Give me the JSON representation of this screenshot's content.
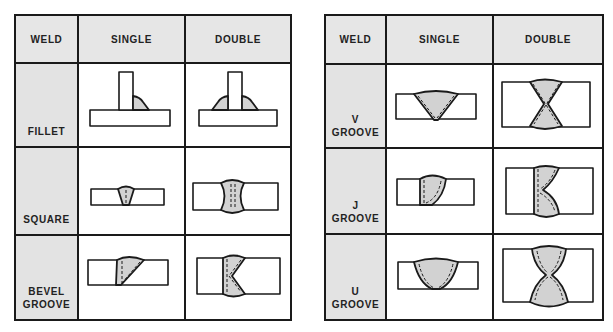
{
  "colors": {
    "header_bg": "#e6e6e6",
    "label_bg": "#e3e3e3",
    "weld_fill": "#d2d2d2",
    "line": "#1a1a1a"
  },
  "left_table": {
    "headers": [
      "WELD",
      "SINGLE",
      "DOUBLE"
    ],
    "rows": [
      {
        "label_line1": "",
        "label_line2": "FILLET",
        "single": "fillet-single-diagram",
        "double": "fillet-double-diagram"
      },
      {
        "label_line1": "",
        "label_line2": "SQUARE",
        "single": "square-single-diagram",
        "double": "square-double-diagram"
      },
      {
        "label_line1": "BEVEL",
        "label_line2": "GROOVE",
        "single": "bevel-single-diagram",
        "double": "bevel-double-diagram"
      }
    ]
  },
  "right_table": {
    "headers": [
      "WELD",
      "SINGLE",
      "DOUBLE"
    ],
    "rows": [
      {
        "label_line1": "V",
        "label_line2": "GROOVE",
        "single": "v-single-diagram",
        "double": "v-double-diagram"
      },
      {
        "label_line1": "J",
        "label_line2": "GROOVE",
        "single": "j-single-diagram",
        "double": "j-double-diagram"
      },
      {
        "label_line1": "U",
        "label_line2": "GROOVE",
        "single": "u-single-diagram",
        "double": "u-double-diagram"
      }
    ]
  }
}
